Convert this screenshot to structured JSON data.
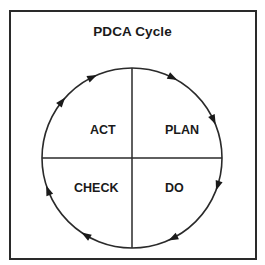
{
  "diagram": {
    "title": "PDCA Cycle",
    "quadrants": [
      {
        "id": "act",
        "label": "ACT",
        "position": "top-left"
      },
      {
        "id": "plan",
        "label": "PLAN",
        "position": "top-right"
      },
      {
        "id": "check",
        "label": "CHECK",
        "position": "bottom-left"
      },
      {
        "id": "do",
        "label": "DO",
        "position": "bottom-right"
      }
    ],
    "flow_direction": "clockwise",
    "sequence": [
      "PLAN",
      "DO",
      "CHECK",
      "ACT"
    ],
    "arrow_count": 8,
    "colors": {
      "stroke": "#2a2a2a",
      "text": "#1a1a1a",
      "background": "#ffffff"
    }
  }
}
